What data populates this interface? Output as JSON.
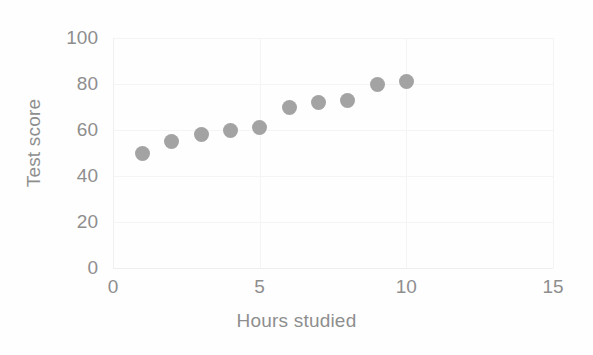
{
  "chart_data": {
    "type": "scatter",
    "title": "",
    "xlabel": "Hours studied",
    "ylabel": "Test score",
    "xlim": [
      0,
      15
    ],
    "ylim": [
      0,
      100
    ],
    "xticks": [
      0,
      5,
      10,
      15
    ],
    "yticks": [
      0,
      20,
      40,
      60,
      80,
      100
    ],
    "xtick_labels": [
      "0",
      "5",
      "10",
      "15"
    ],
    "ytick_labels": [
      "0",
      "20",
      "40",
      "60",
      "80",
      "100"
    ],
    "grid": true,
    "legend": null,
    "marker_color": "#9b9b9b",
    "marker_shape": "circle",
    "series": [
      {
        "name": "Test score vs hours studied",
        "x": [
          1,
          2,
          3,
          4,
          5,
          6,
          7,
          8,
          9,
          10
        ],
        "y": [
          50,
          55,
          58,
          60,
          61,
          70,
          72,
          73,
          80,
          81
        ],
        "points": [
          {
            "x": 1,
            "y": 50
          },
          {
            "x": 2,
            "y": 55
          },
          {
            "x": 3,
            "y": 58
          },
          {
            "x": 4,
            "y": 60
          },
          {
            "x": 5,
            "y": 61
          },
          {
            "x": 6,
            "y": 70
          },
          {
            "x": 7,
            "y": 72
          },
          {
            "x": 8,
            "y": 73
          },
          {
            "x": 9,
            "y": 80
          },
          {
            "x": 10,
            "y": 81
          }
        ]
      }
    ]
  },
  "colors": {
    "marker": "#9b9b9b",
    "axis_text": "#8e8e8e",
    "gridline": "#f4f4f4",
    "background": "#fefefe"
  }
}
